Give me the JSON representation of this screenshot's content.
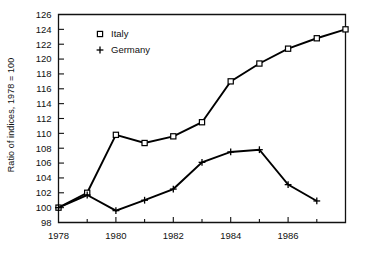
{
  "chart_data": {
    "type": "line",
    "title": "",
    "xlabel": "",
    "ylabel": "Ratio of indices, 1978 = 100",
    "xlim": [
      1978,
      1988
    ],
    "ylim": [
      98,
      126
    ],
    "ytick_step": 2,
    "grid": false,
    "legend_position": "top-left",
    "x": [
      1978,
      1979,
      1980,
      1981,
      1982,
      1983,
      1984,
      1985,
      1986,
      1987,
      1988
    ],
    "xticklabels": [
      "1978",
      "1980",
      "1982",
      "1984",
      "1986"
    ],
    "xtick_values": [
      1978,
      1980,
      1982,
      1984,
      1986
    ],
    "xminor_values": [
      1979,
      1981,
      1983,
      1985,
      1987
    ],
    "yticklabels": [
      "98",
      "100",
      "102",
      "104",
      "106",
      "108",
      "110",
      "112",
      "114",
      "116",
      "118",
      "120",
      "122",
      "124",
      "126"
    ],
    "ytick_values": [
      98,
      100,
      102,
      104,
      106,
      108,
      110,
      112,
      114,
      116,
      118,
      120,
      122,
      124,
      126
    ],
    "series": [
      {
        "name": "Italy",
        "marker": "square",
        "x": [
          1978,
          1979,
          1980,
          1981,
          1982,
          1983,
          1984,
          1985,
          1986,
          1987,
          1988
        ],
        "values": [
          100.0,
          102.0,
          109.8,
          108.7,
          109.6,
          111.5,
          117.0,
          119.4,
          121.4,
          122.8,
          124.0
        ]
      },
      {
        "name": "Germany",
        "marker": "plus",
        "x": [
          1978,
          1979,
          1980,
          1981,
          1982,
          1983,
          1984,
          1985,
          1986,
          1987
        ],
        "values": [
          100.0,
          101.7,
          99.6,
          101.0,
          102.5,
          106.1,
          107.5,
          107.8,
          103.1,
          100.9
        ]
      }
    ],
    "legend": [
      {
        "label": "Italy",
        "marker": "square"
      },
      {
        "label": "Germany",
        "marker": "plus"
      }
    ],
    "colors": {
      "line": "#000000",
      "marker_fill": "#ffffff",
      "axis": "#111111",
      "background": "#ffffff"
    }
  }
}
